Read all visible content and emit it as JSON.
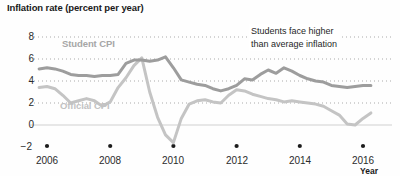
{
  "chart_data": {
    "type": "line",
    "title": "Inflation rate (percent per year)",
    "xlabel": "Year",
    "ylabel": "",
    "xlim": [
      2005.6,
      2016.6
    ],
    "ylim": [
      -2,
      8
    ],
    "grid": "dotted horizontal gridlines at 2, 4, 6, 8; solid zero line",
    "legend_position": "inline labels on plot",
    "yticks": [
      "8",
      "6",
      "4",
      "2",
      "0",
      "−2"
    ],
    "ytick_values": [
      8,
      6,
      4,
      2,
      0,
      -2
    ],
    "xticks": [
      "2006",
      "2008",
      "2010",
      "2012",
      "2014",
      "2016"
    ],
    "xtick_values": [
      2006,
      2008,
      2010,
      2012,
      2014,
      2016
    ],
    "annotations": [
      {
        "text_line1": "Students face higher",
        "text_line2": "than average inflation"
      }
    ],
    "series": [
      {
        "name": "Student CPI",
        "color": "#9d9d9d",
        "label_x": 2007.3,
        "label_y": 6.55,
        "x": [
          2005.75,
          2006.0,
          2006.25,
          2006.5,
          2006.75,
          2007.0,
          2007.25,
          2007.5,
          2007.75,
          2008.0,
          2008.25,
          2008.5,
          2008.75,
          2009.0,
          2009.25,
          2009.5,
          2009.75,
          2010.0,
          2010.25,
          2010.5,
          2010.75,
          2011.0,
          2011.25,
          2011.5,
          2011.75,
          2012.0,
          2012.25,
          2012.5,
          2012.75,
          2013.0,
          2013.25,
          2013.5,
          2013.75,
          2014.0,
          2014.25,
          2014.5,
          2014.75,
          2015.0,
          2015.25,
          2015.5,
          2015.75,
          2016.0,
          2016.25
        ],
        "y": [
          5.1,
          5.2,
          5.1,
          4.9,
          4.6,
          4.5,
          4.5,
          4.4,
          4.5,
          4.5,
          4.6,
          5.6,
          5.9,
          5.9,
          5.8,
          5.9,
          6.2,
          5.2,
          4.1,
          3.9,
          3.7,
          3.6,
          3.3,
          3.1,
          3.3,
          3.6,
          4.2,
          4.1,
          4.6,
          5.0,
          4.7,
          5.2,
          4.9,
          4.5,
          4.2,
          4.0,
          3.9,
          3.6,
          3.5,
          3.4,
          3.5,
          3.6,
          3.6
        ]
      },
      {
        "name": "Official CPI",
        "color": "#c4c4c4",
        "label_x": 2007.2,
        "label_y": 1.35,
        "x": [
          2005.75,
          2006.0,
          2006.25,
          2006.5,
          2006.75,
          2007.0,
          2007.25,
          2007.5,
          2007.75,
          2008.0,
          2008.25,
          2008.5,
          2008.75,
          2009.0,
          2009.25,
          2009.5,
          2009.75,
          2010.0,
          2010.25,
          2010.5,
          2010.75,
          2011.0,
          2011.25,
          2011.5,
          2011.75,
          2012.0,
          2012.25,
          2012.5,
          2012.75,
          2013.0,
          2013.25,
          2013.5,
          2013.75,
          2014.0,
          2014.25,
          2014.5,
          2014.75,
          2015.0,
          2015.25,
          2015.5,
          2015.75,
          2016.0,
          2016.25
        ],
        "y": [
          3.4,
          3.5,
          3.3,
          2.7,
          2.0,
          2.2,
          2.4,
          2.2,
          1.7,
          2.1,
          3.4,
          4.3,
          5.4,
          6.1,
          3.0,
          0.7,
          -0.9,
          -1.6,
          0.6,
          1.9,
          2.2,
          2.3,
          2.1,
          2.0,
          2.7,
          3.2,
          3.1,
          2.8,
          2.6,
          2.4,
          2.3,
          2.1,
          2.2,
          2.1,
          2.0,
          1.9,
          1.7,
          1.3,
          0.9,
          0.1,
          0.0,
          0.6,
          1.1
        ]
      }
    ]
  },
  "chart": {
    "title": "Inflation rate (percent per year)",
    "xaxis_title": "Year",
    "annotation_line1": "Students face higher",
    "annotation_line2": "than average inflation",
    "student_label": "Student CPI",
    "official_label": "Official CPI",
    "ytick_0": "8",
    "ytick_1": "6",
    "ytick_2": "4",
    "ytick_3": "2",
    "ytick_4": "0",
    "ytick_5": "−2",
    "xtick_0": "2006",
    "xtick_1": "2008",
    "xtick_2": "2010",
    "xtick_3": "2012",
    "xtick_4": "2014",
    "xtick_5": "2016",
    "colors": {
      "student": "#9d9d9d",
      "official": "#c4c4c4",
      "grid": "#aaaaaa",
      "zero_line": "#cfcfcf",
      "text": "#2b2b2b"
    }
  }
}
